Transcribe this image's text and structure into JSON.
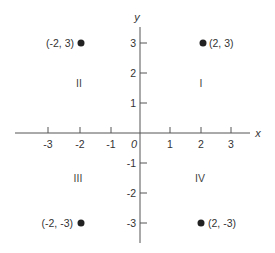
{
  "diagram": {
    "type": "cartesian-coordinate-plane",
    "axes": {
      "x_label": "x",
      "y_label": "y",
      "origin_label": "0",
      "x_ticks": [
        "-3",
        "-2",
        "-1",
        "1",
        "2",
        "3"
      ],
      "y_ticks": [
        "3",
        "2",
        "1",
        "-1",
        "-2",
        "-3"
      ]
    },
    "quadrants": {
      "I": "I",
      "II": "II",
      "III": "III",
      "IV": "IV"
    },
    "points": [
      {
        "label": "(-2, 3)",
        "x": -2,
        "y": 3
      },
      {
        "label": "(2, 3)",
        "x": 2,
        "y": 3
      },
      {
        "label": "(-2, -3)",
        "x": -2,
        "y": -3
      },
      {
        "label": "(2, -3)",
        "x": 2,
        "y": -3
      }
    ],
    "colors": {
      "axis": "#555555",
      "point": "#222222",
      "text": "#333333"
    }
  }
}
